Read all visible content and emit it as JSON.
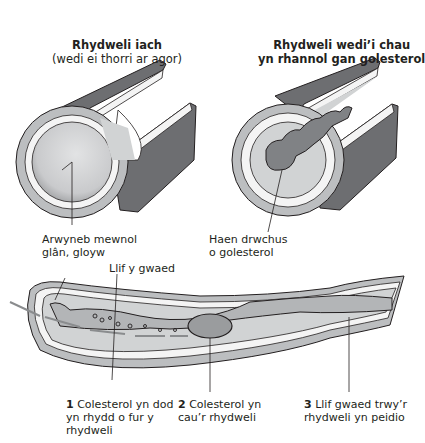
{
  "diagram": {
    "healthy_artery": {
      "title": "Rhydweli iach",
      "subtitle": "(wedi ei thorri ar agor)",
      "label_inner_surface_line1": "Arwyneb mewnol",
      "label_inner_surface_line2": "glân, gloyw"
    },
    "blocked_artery": {
      "title_line1": "Rhydweli wedi’i chau",
      "title_line2": "yn rhannol gan golesterol",
      "label_layer_line1": "Haen drwchus",
      "label_layer_line2": "o golesterol"
    },
    "long_artery": {
      "label_blood_flow": "Llif y gwaed",
      "steps": [
        {
          "num": "1",
          "line1": "Colesterol yn dod",
          "line2": "yn rhydd o fur y",
          "line3": "rhydweli"
        },
        {
          "num": "2",
          "line1": "Colesterol yn",
          "line2": "cau’r rhydweli"
        },
        {
          "num": "3",
          "line1": "Llif gwaed trwy’r",
          "line2": "rhydweli yn peidio"
        }
      ]
    },
    "colors": {
      "outer_wall": "#6d6e71",
      "wall_layer": "#bcbec0",
      "lumen": "#d1d3d4",
      "white_layer": "#f4f4f4",
      "arrow": "#8a8c8e",
      "outline": "#231f20"
    }
  }
}
